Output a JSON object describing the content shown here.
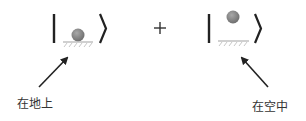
{
  "diagram": {
    "title": "",
    "operator": "+",
    "kets": [
      {
        "id": "ground",
        "description": "ball resting on ground"
      },
      {
        "id": "air",
        "description": "ball floating in the air"
      }
    ],
    "annotations": [
      {
        "text": "在地上",
        "points_to": "ground"
      },
      {
        "text": "在空中",
        "points_to": "air"
      }
    ]
  },
  "colors": {
    "stroke": "#222222",
    "ball": "#8a8a8a",
    "ground_line": "#b5b5b5",
    "hatch": "#bdbdbd",
    "text": "#333333",
    "background": "#ffffff"
  }
}
